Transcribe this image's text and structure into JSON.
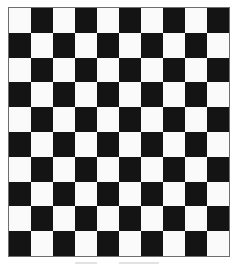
{
  "board": {
    "rows": 10,
    "columns": 10,
    "top_left_color": "light",
    "colors": {
      "light": "#fafafa",
      "dark": "#141414",
      "border": "#6e6e6e"
    }
  }
}
